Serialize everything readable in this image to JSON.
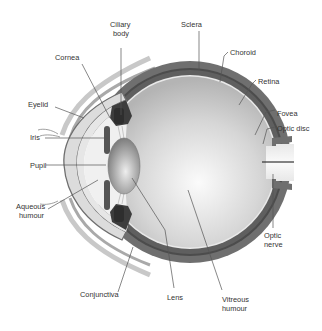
{
  "diagram": {
    "colors": {
      "sclera": "#6f6f6f",
      "choroid": "#4a4a4a",
      "retina_line": "#ececec",
      "vitreous_light": "#f4f4f4",
      "vitreous_dark": "#b8b8b8",
      "cornea": "#d9d9d9",
      "lens": "#a8a8a8",
      "iris": "#555555",
      "eyelid": "#bdbdbd",
      "optic_nerve_fill": "#efefef",
      "label_text": "#333333",
      "leader_line": "#555555"
    },
    "labels": {
      "ciliary_body_1": "Ciliary",
      "ciliary_body_2": "body",
      "sclera": "Sclera",
      "choroid": "Choroid",
      "retina": "Retina",
      "fovea": "Fovea",
      "optic_disc": "Optic disc",
      "cornea": "Cornea",
      "eyelid": "Eyelid",
      "iris": "Iris",
      "pupil": "Pupil",
      "aqueous_humour_1": "Aqueous",
      "aqueous_humour_2": "humour",
      "conjunctiva": "Conjunctiva",
      "lens": "Lens",
      "vitreous_humour_1": "Vitreous",
      "vitreous_humour_2": "humour",
      "optic_nerve_1": "Optic",
      "optic_nerve_2": "nerve"
    }
  }
}
